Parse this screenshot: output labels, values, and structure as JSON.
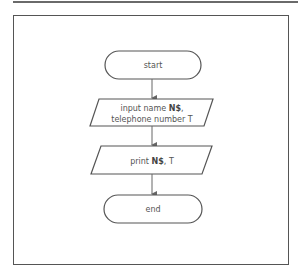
{
  "diagram": {
    "type": "flowchart",
    "nodes": [
      {
        "id": "start",
        "shape": "terminator",
        "label": "start"
      },
      {
        "id": "input",
        "shape": "parallelogram",
        "label_line1_prefix": "input name ",
        "label_line1_var": "N$",
        "label_line1_suffix": ",",
        "label_line2_prefix": "telephone number ",
        "label_line2_var": "T"
      },
      {
        "id": "print",
        "shape": "parallelogram",
        "label_prefix": "print ",
        "label_var": "N$",
        "label_suffix": ", T"
      },
      {
        "id": "end",
        "shape": "terminator",
        "label": "end"
      }
    ],
    "edges": [
      {
        "from": "start",
        "to": "input"
      },
      {
        "from": "input",
        "to": "print"
      },
      {
        "from": "print",
        "to": "end"
      }
    ],
    "colors": {
      "stroke": "#555555",
      "arrow": "#666666",
      "text": "#555555",
      "background": "#ffffff"
    }
  }
}
